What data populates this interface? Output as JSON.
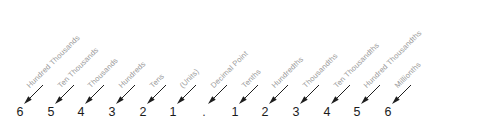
{
  "figure": {
    "kind": "place-value-chart",
    "background_color": "#ffffff",
    "label_color": "#9a9a9a",
    "digit_color": "#1b1b1b",
    "arrow_color": "#1e1e1e",
    "label_rotation_deg": -45,
    "number_shown": "654321.123456"
  },
  "chart_data": {
    "type": "table",
    "title": "",
    "xlabel": "",
    "ylabel": "",
    "categories": [
      "Hundred Thousands",
      "Ten Thousands",
      "Thousands",
      "Hundreds",
      "Tens",
      "(Units)",
      "Decimal Point",
      "Tenths",
      "Hundredths",
      "Thousandths",
      "Ten Thousandths",
      "Hundred Thousandths",
      "Millionths"
    ],
    "values": [
      "6",
      "5",
      "4",
      "3",
      "2",
      "1",
      ".",
      "1",
      "2",
      "3",
      "4",
      "5",
      "6"
    ]
  },
  "columns": [
    {
      "digit": "6",
      "label": "Hundred Thousands",
      "x": 20,
      "label_x": 31,
      "label_y": 82
    },
    {
      "digit": "5",
      "label": "Ten Thousands",
      "x": 51,
      "label_x": 62,
      "label_y": 82
    },
    {
      "digit": "4",
      "label": "Thousands",
      "x": 81,
      "label_x": 92,
      "label_y": 82
    },
    {
      "digit": "3",
      "label": "Hundreds",
      "x": 112,
      "label_x": 123,
      "label_y": 82
    },
    {
      "digit": "2",
      "label": "Tens",
      "x": 143,
      "label_x": 154,
      "label_y": 82
    },
    {
      "digit": "1",
      "label": "(Units)",
      "x": 173,
      "label_x": 184,
      "label_y": 82
    },
    {
      "digit": ".",
      "label": "Decimal Point",
      "x": 204,
      "label_x": 215,
      "label_y": 82
    },
    {
      "digit": "1",
      "label": "Tenths",
      "x": 235,
      "label_x": 246,
      "label_y": 82
    },
    {
      "digit": "2",
      "label": "Hundredths",
      "x": 265,
      "label_x": 276,
      "label_y": 82
    },
    {
      "digit": "3",
      "label": "Thousandths",
      "x": 296,
      "label_x": 307,
      "label_y": 82
    },
    {
      "digit": "4",
      "label": "Ten Thousandths",
      "x": 327,
      "label_x": 338,
      "label_y": 82
    },
    {
      "digit": "5",
      "label": "Hundred Thousandths",
      "x": 357,
      "label_x": 368,
      "label_y": 82
    },
    {
      "digit": "6",
      "label": "Millionths",
      "x": 388,
      "label_x": 399,
      "label_y": 82
    }
  ],
  "geometry": {
    "baseline_y": 118,
    "arrow_dx": 19,
    "arrow_dy": 19,
    "arrow_tip_offset_x": 4,
    "arrow_tip_offset_y": 14
  }
}
